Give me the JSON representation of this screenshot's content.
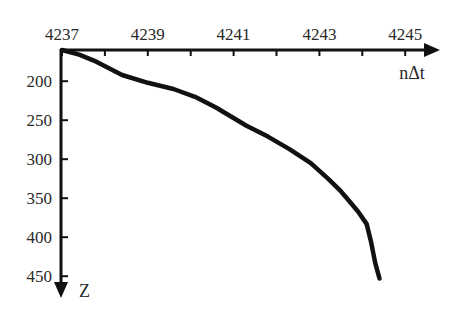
{
  "chart_data": {
    "type": "line",
    "title": "",
    "xlabel": "nΔt",
    "ylabel": "Z",
    "x_axis_position": "top",
    "y_axis_inverted": true,
    "grid": false,
    "legend": null,
    "xlim": [
      4237,
      4245
    ],
    "ylim": [
      160,
      460
    ],
    "x_ticks": [
      4237,
      4238,
      4239,
      4240,
      4241,
      4242,
      4243,
      4244,
      4245
    ],
    "x_tick_labels": [
      "4237",
      "4239",
      "4241",
      "4243",
      "4245"
    ],
    "y_ticks": [
      200,
      250,
      300,
      350,
      400,
      450
    ],
    "y_tick_labels": [
      "200",
      "250",
      "300",
      "350",
      "400",
      "450"
    ],
    "series": [
      {
        "name": "Z vs nΔt",
        "color": "#111111",
        "x": [
          4237.0,
          4237.4,
          4237.8,
          4238.4,
          4239.0,
          4239.6,
          4240.1,
          4240.6,
          4240.9,
          4241.3,
          4241.8,
          4242.3,
          4242.8,
          4243.2,
          4243.5,
          4243.7,
          4243.9,
          4244.1,
          4244.2,
          4244.3,
          4244.4
        ],
        "values": [
          160,
          166,
          175,
          192,
          202,
          210,
          220,
          234,
          244,
          257,
          271,
          287,
          305,
          325,
          341,
          354,
          367,
          383,
          405,
          433,
          453
        ]
      }
    ]
  },
  "labels": {
    "x_axis_title": "nΔt",
    "y_axis_title": "Z"
  }
}
